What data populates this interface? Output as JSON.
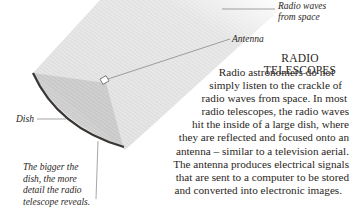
{
  "illustration": {
    "subject": "radio-telescope-dish-diagram",
    "colors": {
      "waves": "#d6d6d6",
      "reflection": "#c4c4c4",
      "dish_rim": "#3a3634",
      "leader_line": "#6e6a66"
    }
  },
  "labels": {
    "waves_line1": "Radio waves",
    "waves_line2": "from space",
    "antenna": "Antenna",
    "dish": "Dish"
  },
  "caption": {
    "lines": [
      "The bigger the",
      "dish, the more",
      "detail the radio",
      "telescope reveals."
    ]
  },
  "article": {
    "title": "RADIO TELESCOPES",
    "lines": [
      "Radio astronomers do not",
      "simply listen to the crackle of",
      "radio waves from space. In most",
      "radio telescopes, the radio waves",
      "hit the inside of a large dish, where",
      "they are reflected and focused onto an",
      "antenna – similar to a television aerial.",
      "The antenna produces electrical signals",
      "that are sent to a computer to be stored",
      "and converted into electronic images."
    ]
  }
}
